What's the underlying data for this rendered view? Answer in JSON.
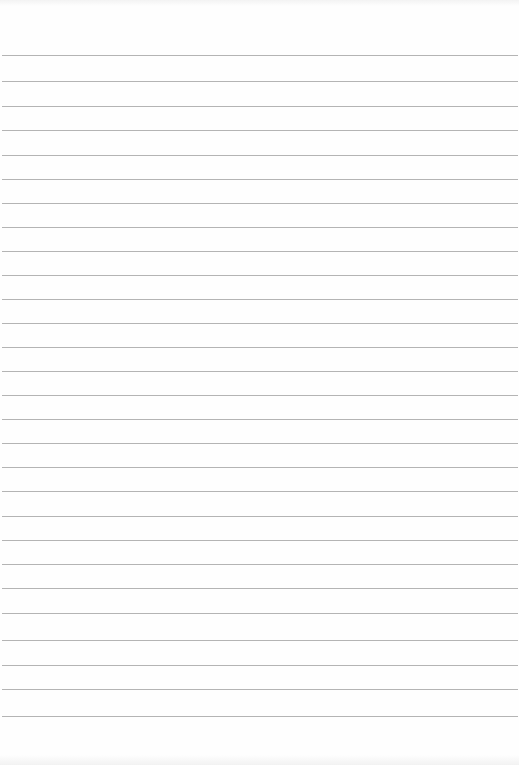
{
  "paper": {
    "type": "lined-notebook-paper",
    "background": "#fefefe",
    "line_color": "#b4b4b4",
    "line_positions": [
      55,
      81,
      106,
      130,
      155,
      179,
      203,
      227,
      251,
      275,
      299,
      323,
      347,
      371,
      395,
      419,
      443,
      467,
      491,
      516,
      540,
      564,
      588,
      613,
      640,
      665,
      689,
      716
    ]
  }
}
